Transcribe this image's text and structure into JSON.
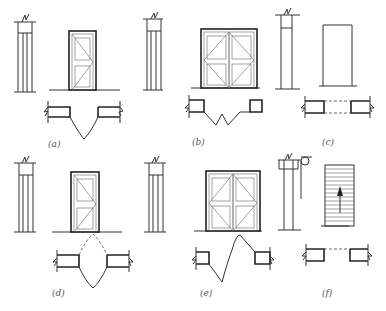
{
  "figure": {
    "panels": [
      {
        "id": "a",
        "label": "(a)",
        "type": "single-swing door"
      },
      {
        "id": "b",
        "label": "(b)",
        "type": "double-swing double door"
      },
      {
        "id": "c",
        "label": "(c)",
        "type": "opening without door"
      },
      {
        "id": "d",
        "label": "(d)",
        "type": "double-acting single door"
      },
      {
        "id": "e",
        "label": "(e)",
        "type": "double-acting double door"
      },
      {
        "id": "f",
        "label": "(f)",
        "type": "rolling shutter door"
      }
    ]
  }
}
